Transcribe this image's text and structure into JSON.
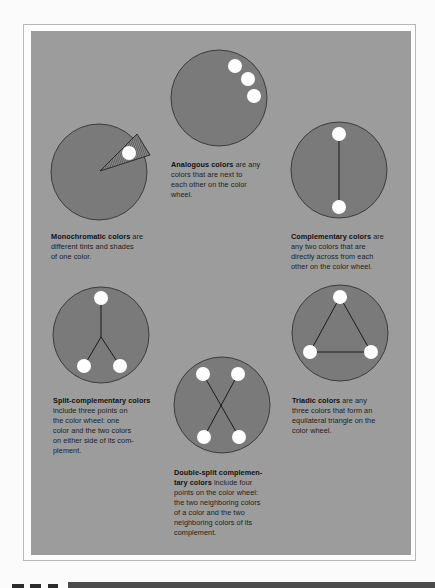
{
  "figure": {
    "colors": {
      "page_background": "#fbfbfb",
      "panel_background": "#9c9c9c",
      "wheel_fill": "#7a7a7a",
      "dot_fill": "#ffffff",
      "line_color": "#1a1a1a"
    },
    "schemes": [
      {
        "id": "analogous",
        "term": "Analogous colors",
        "description": " are any colors that are next to each other on the color wheel.",
        "lines": [
          "are any",
          "colors that are next to",
          "each other on the color",
          "wheel."
        ]
      },
      {
        "id": "monochromatic",
        "term": "Monochromatic colors",
        "description": " are different tints and shades of one color.",
        "lines": [
          "are",
          "different tints and shades",
          "of one color."
        ]
      },
      {
        "id": "complementary",
        "term": "Complementary colors",
        "description": " are any two colors that are directly across from each other on the color wheel.",
        "lines": [
          "are",
          "any two colors that are",
          "directly across from each",
          "other on the color wheel."
        ]
      },
      {
        "id": "split-complementary",
        "term": "Split-complementary colors",
        "description": " include three points on the color wheel: one color and the two colors on either side of its complement.",
        "lines": [
          "",
          "include three points on",
          "the color wheel:  one",
          "color and the two colors",
          "on either side of its com-",
          "plement."
        ]
      },
      {
        "id": "triadic",
        "term": "Triadic colors",
        "description": " are any three colors that form an equilateral triangle on the color wheel.",
        "lines": [
          "are any",
          "three colors that form an",
          "equilateral triangle on the",
          "color wheel."
        ]
      },
      {
        "id": "double-split-complementary",
        "term_line1": "Double-split complemen-",
        "term_line2": "tary colors",
        "description": " include four points on the color wheel: the two neighboring colors of a color and the two neighboring colors of its complement.",
        "lines": [
          "include four",
          "points on the color wheel:",
          "the two neighboring colors",
          "of a color and the two",
          "neighboring colors of its",
          "complement."
        ]
      }
    ]
  }
}
